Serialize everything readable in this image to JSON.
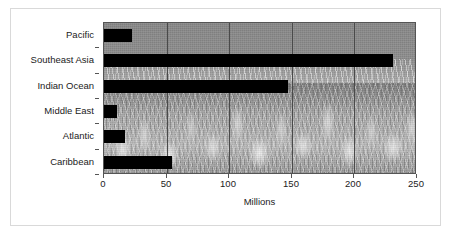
{
  "chart_data": {
    "type": "bar",
    "orientation": "horizontal",
    "title": "",
    "xlabel": "Millions",
    "ylabel": "",
    "categories": [
      "Pacific",
      "Southeast Asia",
      "Indian Ocean",
      "Middle East",
      "Atlantic",
      "Caribbean"
    ],
    "values": [
      22,
      231,
      147,
      10,
      17,
      54
    ],
    "xlim": [
      0,
      250
    ],
    "xticks": [
      0,
      50,
      100,
      150,
      200,
      250
    ],
    "xticklabels": [
      "0",
      "50",
      "100",
      "150",
      "200",
      "250"
    ],
    "grid": "vertical",
    "legend": "none",
    "series": [
      {
        "name": "Millions",
        "values": [
          22,
          231,
          147,
          10,
          17,
          54
        ]
      }
    ],
    "bar_color": "#000000",
    "plot_background": "coral-reef-photograph-greyscale",
    "axis_color": "#555555",
    "gridline_color": "#4a4a4a",
    "frame_color": "#d9d9d9"
  }
}
